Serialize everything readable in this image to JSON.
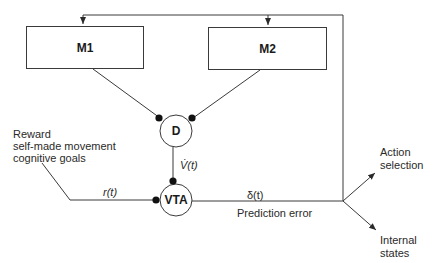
{
  "diagram": {
    "nodes": {
      "m1": {
        "label": "M1"
      },
      "m2": {
        "label": "M2"
      },
      "d": {
        "label": "D"
      },
      "vta": {
        "label": "VTA"
      }
    },
    "edges": {
      "v_dot": {
        "label": "V̇(t)"
      },
      "r": {
        "label": "r(t)"
      },
      "delta": {
        "label": "δ(t)"
      },
      "prediction_error": {
        "label": "Prediction error"
      }
    },
    "inputs": {
      "reward_line1": "Reward",
      "reward_line2": "self-made movement",
      "reward_line3": "cognitive goals"
    },
    "outputs": {
      "action_line1": "Action",
      "action_line2": "selection",
      "internal_line1": "Internal",
      "internal_line2": "states"
    }
  }
}
